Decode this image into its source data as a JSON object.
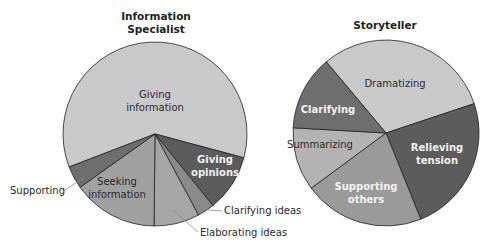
{
  "chart_data": [
    {
      "type": "pie",
      "title": "Information Specialist",
      "title_lines": [
        "Information",
        "Specialist"
      ],
      "slices": [
        {
          "label": "Giving information",
          "value": 60,
          "color": "#c9c9c9"
        },
        {
          "label": "Giving opinions",
          "value": 10,
          "color": "#5c5c5c"
        },
        {
          "label": "Clarifying ideas",
          "value": 3,
          "color": "#8a8a8a"
        },
        {
          "label": "Elaborating ideas",
          "value": 8,
          "color": "#a6a6a6"
        },
        {
          "label": "Seeking information",
          "value": 15,
          "color": "#a0a0a0"
        },
        {
          "label": "Supporting",
          "value": 4,
          "color": "#6e6e6e"
        }
      ],
      "start_angle_deg": 159
    },
    {
      "type": "pie",
      "title": "Storyteller",
      "slices": [
        {
          "label": "Dramatizing",
          "value": 31,
          "color": "#c9c9c9"
        },
        {
          "label": "Relieving tension",
          "value": 24,
          "color": "#5c5c5c"
        },
        {
          "label": "Supporting others",
          "value": 21,
          "color": "#9a9a9a"
        },
        {
          "label": "Summarizing",
          "value": 11,
          "color": "#b3b3b3"
        },
        {
          "label": "Clarifying",
          "value": 13,
          "color": "#6e6e6e"
        }
      ],
      "start_angle_deg": 230
    }
  ],
  "labels": {
    "left_title_1": "Information",
    "left_title_2": "Specialist",
    "giving_info_1": "Giving",
    "giving_info_2": "information",
    "giving_op_1": "Giving",
    "giving_op_2": "opinions",
    "seeking_1": "Seeking",
    "seeking_2": "information",
    "supporting": "Supporting",
    "clarifying_ideas": "Clarifying ideas",
    "elaborating_ideas": "Elaborating ideas",
    "right_title": "Storyteller",
    "dramatizing": "Dramatizing",
    "clarifying": "Clarifying",
    "summarizing": "Summarizing",
    "relieving_1": "Relieving",
    "relieving_2": "tension",
    "supporting_others_1": "Supporting",
    "supporting_others_2": "others"
  }
}
